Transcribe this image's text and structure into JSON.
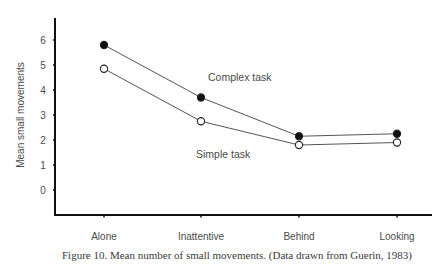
{
  "chart_data": {
    "type": "line",
    "title": "",
    "caption": "Figure 10. Mean number of small movements. (Data drawn from Guerin, 1983)",
    "xlabel": "",
    "ylabel": "Mean small movements",
    "categories": [
      "Alone",
      "Inattentive",
      "Behind",
      "Looking"
    ],
    "yticks": [
      "0",
      "1",
      "2",
      "3",
      "4",
      "5",
      "6"
    ],
    "ylim": [
      -1,
      7
    ],
    "grid": false,
    "legend_position": "inline annotations",
    "series": [
      {
        "name": "Complex task",
        "marker": "filled-circle",
        "values": [
          5.8,
          3.7,
          2.15,
          2.25
        ]
      },
      {
        "name": "Simple task",
        "marker": "open-circle",
        "values": [
          4.85,
          2.75,
          1.8,
          1.9
        ]
      }
    ],
    "annotations": [
      {
        "text": "Complex task",
        "near": "Complex task series"
      },
      {
        "text": "Simple task",
        "near": "Simple task series"
      }
    ]
  }
}
